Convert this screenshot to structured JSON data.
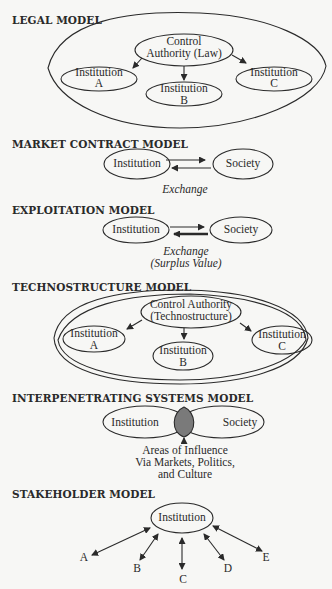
{
  "diagram": {
    "models": [
      {
        "title": "LEGAL MODEL",
        "nodes": {
          "authority": [
            "Control",
            "Authority (Law)"
          ],
          "inst_a": [
            "Institution",
            "A"
          ],
          "inst_b": [
            "Institution",
            "B"
          ],
          "inst_c": [
            "Institution",
            "C"
          ]
        }
      },
      {
        "title": "MARKET CONTRACT MODEL",
        "nodes": {
          "left": "Institution",
          "right": "Society"
        },
        "edge_label": "Exchange"
      },
      {
        "title": "EXPLOITATION MODEL",
        "nodes": {
          "left": "Institution",
          "right": "Society"
        },
        "edge_label": [
          "Exchange",
          "(Surplus Value)"
        ]
      },
      {
        "title": "TECHNOSTRUCTURE MODEL",
        "nodes": {
          "authority": [
            "Control Authority",
            "(Technostructure)"
          ],
          "inst_a": [
            "Institution",
            "A"
          ],
          "inst_b": [
            "Institution",
            "B"
          ],
          "inst_c": [
            "Institution",
            "C"
          ]
        }
      },
      {
        "title": "INTERPENETRATING SYSTEMS MODEL",
        "nodes": {
          "left": "Institution",
          "right": "Society"
        },
        "overlap_label": [
          "Areas of Influence",
          "Via Markets, Politics,",
          "and Culture"
        ]
      },
      {
        "title": "STAKEHOLDER MODEL",
        "nodes": {
          "center": "Institution"
        },
        "stakeholders": [
          "A",
          "B",
          "C",
          "D",
          "E"
        ]
      }
    ],
    "colors": {
      "ink": "#2a2a2a",
      "overlap_fill": "#7a7a7a",
      "background": "#f7f7f5"
    }
  }
}
